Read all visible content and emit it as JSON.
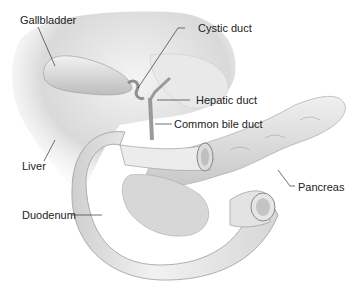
{
  "diagram": {
    "type": "anatomical-illustration",
    "labels": {
      "gallbladder": "Gallbladder",
      "cystic_duct": "Cystic duct",
      "hepatic_duct": "Hepatic duct",
      "common_bile_duct": "Common bile duct",
      "liver": "Liver",
      "pancreas": "Pancreas",
      "duodenum": "Duodenum"
    }
  }
}
